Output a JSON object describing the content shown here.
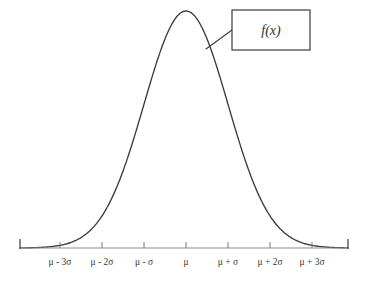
{
  "figure": {
    "background_color": "#ffffff",
    "curve_color": "#3b3b3b",
    "axis_color": "#8d8d8d",
    "label_color": "#3a3a3a"
  },
  "callout": {
    "label": "f(x)",
    "box": {
      "x": 232,
      "y": 10,
      "width": 78,
      "height": 40
    },
    "leader": {
      "x1": 206,
      "y1": 49,
      "x2": 232,
      "y2": 30
    }
  },
  "axis": {
    "y": 248,
    "x_start": 20,
    "x_end": 348,
    "cap_height": 9,
    "tick_height": 6
  },
  "chart_data": {
    "type": "line",
    "title": "",
    "subtitle": "",
    "xlabel": "",
    "ylabel": "",
    "legend": [],
    "grid": false,
    "distribution": "normal",
    "mean_label": "μ",
    "sigma_label": "σ",
    "peak_pixel": {
      "x": 186,
      "y": 11
    },
    "baseline_pixel_y": 248,
    "pixels_per_sigma": 42,
    "tick_labels": [
      "μ - 3σ",
      "μ - 2σ",
      "μ - σ",
      "μ",
      "μ + σ",
      "μ + 2σ",
      "μ + 3σ"
    ],
    "x": [
      -3,
      -2,
      -1,
      0,
      1,
      2,
      3
    ],
    "tick_pixel_x": [
      60,
      102,
      144,
      186,
      228,
      270,
      312
    ],
    "xlim": [
      -3.95,
      3.86
    ],
    "ylim": [
      0,
      1
    ],
    "series": [
      {
        "name": "f(x)",
        "description": "standard normal density, normalized so peak = 1",
        "x": [
          -3.95,
          -3.5,
          -3,
          -2.5,
          -2,
          -1.5,
          -1,
          -0.5,
          0,
          0.5,
          1,
          1.5,
          2,
          2.5,
          3,
          3.5,
          3.86
        ],
        "values": [
          0.0004,
          0.0022,
          0.0111,
          0.0439,
          0.1353,
          0.3247,
          0.6065,
          0.8825,
          1.0,
          0.8825,
          0.6065,
          0.3247,
          0.1353,
          0.0439,
          0.0111,
          0.0022,
          0.0005
        ]
      }
    ]
  }
}
